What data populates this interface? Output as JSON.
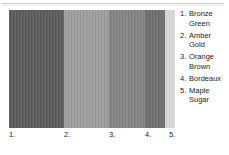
{
  "chart_data": {
    "type": "bar",
    "title": "",
    "subtitle": "",
    "xlabel": "",
    "ylabel": "",
    "grid": false,
    "legend_position": "right",
    "orientation": "vertical-bands",
    "categories": [
      "1.",
      "2.",
      "3.",
      "4.",
      "5."
    ],
    "series": [
      {
        "name": "swatch width",
        "values": [
          55,
          45,
          36,
          20,
          10
        ]
      }
    ],
    "colors": [
      "#5a5a5a",
      "#9e9e9e",
      "#838383",
      "#6e6e6e",
      "#d8d8d8"
    ],
    "swatches": [
      {
        "index": "1.",
        "name": "Bronze Green",
        "name_line1": "Bronze",
        "name_line2": "Green",
        "color": "#5a5a5a",
        "width": 55
      },
      {
        "index": "2.",
        "name": "Amber Gold",
        "name_line1": "Amber",
        "name_line2": "Gold",
        "color": "#9e9e9e",
        "width": 45
      },
      {
        "index": "3.",
        "name": "Orange Brown",
        "name_line1": "Orange",
        "name_line2": "Brown",
        "color": "#838383",
        "width": 36
      },
      {
        "index": "4.",
        "name": "Bordeaux",
        "name_line1": "Bordeaux",
        "name_line2": "",
        "color": "#6e6e6e",
        "width": 20
      },
      {
        "index": "5.",
        "name": "Maple Sugar",
        "name_line1": "Maple",
        "name_line2": "Sugar",
        "color": "#d8d8d8",
        "width": 10
      }
    ]
  },
  "axis": {
    "labels": [
      {
        "text": "1.",
        "left": 9
      },
      {
        "text": "2.",
        "left": 64
      },
      {
        "text": "3.",
        "left": 109
      },
      {
        "text": "4.",
        "left": 145
      },
      {
        "text": "5.",
        "left": 169
      }
    ]
  },
  "legend": {
    "items": [
      {
        "num": "1.",
        "line1": "Bronze",
        "line2": "Green"
      },
      {
        "num": "2.",
        "line1": "Amber",
        "line2": "Gold"
      },
      {
        "num": "3.",
        "line1": "Orange",
        "line2": "Brown"
      },
      {
        "num": "4.",
        "line1": "Bordeaux",
        "line2": ""
      },
      {
        "num": "5.",
        "line1": "Maple",
        "line2": "Sugar"
      }
    ]
  },
  "rule": {
    "color": "#c9c9c9"
  }
}
